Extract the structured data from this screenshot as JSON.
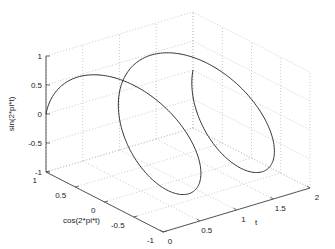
{
  "chart_data": {
    "type": "line",
    "subtype": "3d-helix",
    "title": "",
    "xlabel": "t",
    "ylabel": "cos(2*pi*t)",
    "zlabel": "sin(2*pi*t)",
    "xlim": [
      0,
      2
    ],
    "ylim": [
      -1,
      1
    ],
    "zlim": [
      -1,
      1
    ],
    "grid": true,
    "x_ticks": [
      "0",
      "0.5",
      "1",
      "1.5",
      "2"
    ],
    "y_ticks": [
      "1",
      "0.5",
      "0",
      "-0.5",
      "-1"
    ],
    "z_ticks": [
      "1",
      "0.5",
      "0",
      "-0.5",
      "-1"
    ],
    "series": [
      {
        "name": "helix",
        "x": "t in [0, 2]",
        "y": "cos(2*pi*t)",
        "z": "sin(2*pi*t)",
        "color": "#333333"
      }
    ]
  },
  "labels": {
    "xlabel": "t",
    "ylabel": "cos(2*pi*t)",
    "zlabel": "sin(2*pi*t)"
  }
}
